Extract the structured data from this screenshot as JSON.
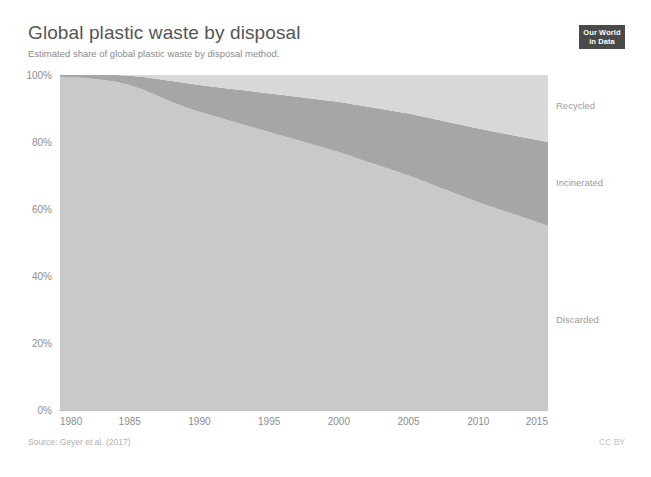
{
  "header": {
    "title": "Global plastic waste by disposal",
    "subtitle": "Estimated share of global plastic waste by disposal method.",
    "logo_line1": "Our World",
    "logo_line2": "in Data"
  },
  "footer": {
    "source": "Source: Geyer et al. (2017)",
    "license": "CC BY"
  },
  "colors": {
    "discarded": "#c9c9c9",
    "incinerated": "#a6a6a6",
    "recycled": "#d8d8d8",
    "axis": "#c2c2c2",
    "tick_text": "#8d8d8d",
    "series_text": "#9c9c9c",
    "title_text": "#555555",
    "subtitle_text": "#8a8a8a",
    "logo_bg": "#4a4a4a"
  },
  "chart_data": {
    "type": "area",
    "stacked": true,
    "stack_total": 100,
    "title": "Global plastic waste by disposal",
    "subtitle": "Estimated share of global plastic waste by disposal method.",
    "xlabel": "",
    "ylabel": "",
    "xlim": [
      1980,
      2015
    ],
    "ylim": [
      0,
      100
    ],
    "grid": false,
    "legend_position": "inline-right",
    "x_ticks": [
      1980,
      1985,
      1990,
      1995,
      2000,
      2005,
      2010,
      2015
    ],
    "x_tick_labels": [
      "1980",
      "1985",
      "1990",
      "1995",
      "2000",
      "2005",
      "2010",
      "2015"
    ],
    "y_ticks": [
      0,
      20,
      40,
      60,
      80,
      100
    ],
    "y_tick_labels": [
      "0%",
      "20%",
      "40%",
      "60%",
      "80%",
      "100%"
    ],
    "x": [
      1980,
      1981,
      1982,
      1983,
      1984,
      1985,
      1986,
      1987,
      1988,
      1989,
      1990,
      1991,
      1992,
      1993,
      1994,
      1995,
      1996,
      1997,
      1998,
      1999,
      2000,
      2001,
      2002,
      2003,
      2004,
      2005,
      2006,
      2007,
      2008,
      2009,
      2010,
      2011,
      2012,
      2013,
      2014,
      2015
    ],
    "series": [
      {
        "name": "Discarded",
        "color": "#c9c9c9",
        "label_x": 2012,
        "label_y": 27,
        "values": [
          99.5,
          99.3,
          99.0,
          98.6,
          98.0,
          97.0,
          95.6,
          93.8,
          92.0,
          90.4,
          89.0,
          87.8,
          86.6,
          85.4,
          84.2,
          83.0,
          81.8,
          80.6,
          79.4,
          78.2,
          77.0,
          75.6,
          74.2,
          72.8,
          71.4,
          70.0,
          68.4,
          66.8,
          65.2,
          63.6,
          62.0,
          60.6,
          59.2,
          57.8,
          56.4,
          55.0
        ]
      },
      {
        "name": "Incinerated",
        "color": "#a6a6a6",
        "label_x": 2012,
        "label_y": 68,
        "values": [
          0.5,
          0.7,
          1.0,
          1.4,
          2.0,
          2.8,
          3.8,
          5.0,
          6.2,
          7.2,
          8.0,
          8.7,
          9.4,
          10.1,
          10.8,
          11.5,
          12.2,
          12.9,
          13.6,
          14.3,
          15.0,
          15.7,
          16.4,
          17.1,
          17.8,
          18.5,
          19.2,
          19.9,
          20.6,
          21.3,
          22.0,
          22.6,
          23.2,
          23.8,
          24.4,
          25.0
        ]
      },
      {
        "name": "Recycled",
        "color": "#d8d8d8",
        "label_x": 2012,
        "label_y": 91,
        "values": [
          0.0,
          0.0,
          0.0,
          0.0,
          0.0,
          0.2,
          0.6,
          1.2,
          1.8,
          2.4,
          3.0,
          3.5,
          4.0,
          4.5,
          5.0,
          5.5,
          6.0,
          6.5,
          7.0,
          7.5,
          8.0,
          8.7,
          9.4,
          10.1,
          10.8,
          11.5,
          12.4,
          13.3,
          14.2,
          15.1,
          16.0,
          16.8,
          17.6,
          18.4,
          19.2,
          20.0
        ]
      }
    ]
  },
  "plot_geometry": {
    "left": 60,
    "right": 548,
    "top": 75,
    "bottom": 410
  }
}
